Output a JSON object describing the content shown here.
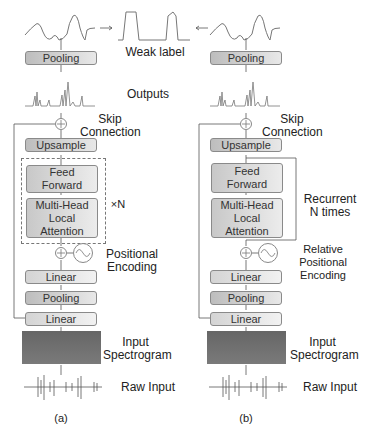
{
  "weak_label": "Weak label",
  "outputs": "Outputs",
  "panel_a": {
    "caption": "(a)",
    "pooling_top": "Pooling",
    "skip": "Skip\nConnection",
    "upsample": "Upsample",
    "feed_forward": "Feed\nForward",
    "attention": "Multi-Head\nLocal\nAttention",
    "repeat": "×N",
    "pos_enc": "Positional\nEncoding",
    "linear_top": "Linear",
    "pooling_mid": "Pooling",
    "linear_bottom": "Linear",
    "spectrogram": "Input\nSpectrogram",
    "raw": "Raw Input"
  },
  "panel_b": {
    "caption": "(b)",
    "pooling_top": "Pooling",
    "skip": "Skip\nConnection",
    "upsample": "Upsample",
    "feed_forward": "Feed\nForward",
    "attention": "Multi-Head\nLocal\nAttention",
    "recurrent": "Recurrent\nN times",
    "pos_enc": "Relative\nPositional\nEncoding",
    "linear_top": "Linear",
    "pooling_mid": "Pooling",
    "linear_bottom": "Linear",
    "spectrogram": "Input\nSpectrogram",
    "raw": "Raw Input"
  }
}
